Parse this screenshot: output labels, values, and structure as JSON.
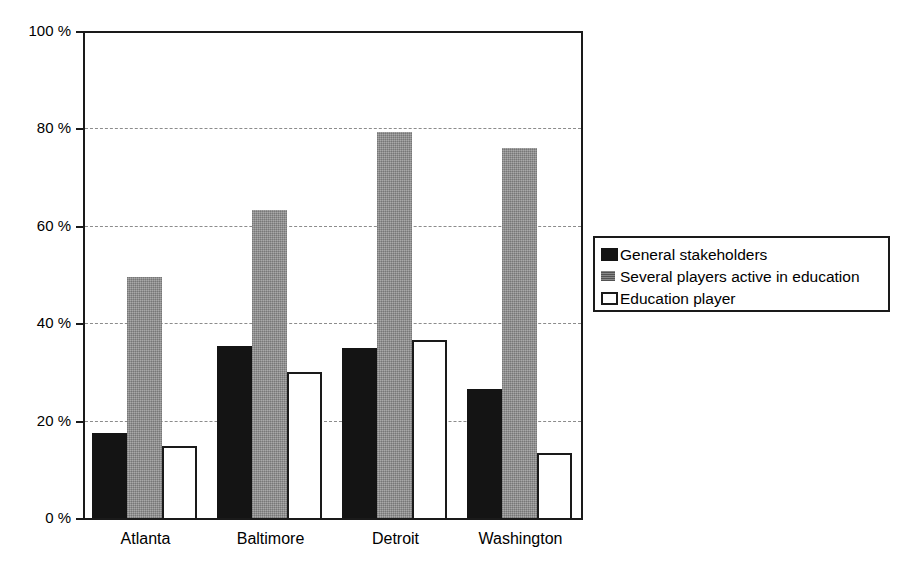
{
  "chart_data": {
    "type": "bar",
    "title": "",
    "subtitle": "",
    "xlabel": "",
    "ylabel": "",
    "grid": true,
    "legend_position": "right",
    "ylim": [
      0,
      100
    ],
    "ytick_values": [
      0,
      20,
      40,
      60,
      80,
      100
    ],
    "ytick_labels": [
      "0 %",
      "20 %",
      "40 %",
      "60 %",
      "80 %",
      "100 %"
    ],
    "categories": [
      "Atlanta",
      "Baltimore",
      "Detroit",
      "Washington"
    ],
    "series": [
      {
        "name": "General stakeholders",
        "color": "#141414",
        "swatch": "solid-black",
        "values": [
          17.5,
          35.3,
          35.0,
          26.5
        ]
      },
      {
        "name": "Several players active in education",
        "color": "#949494",
        "swatch": "gray-halftone",
        "values": [
          49.5,
          63.2,
          79.3,
          76.0
        ]
      },
      {
        "name": "Education player",
        "color": "#ffffff",
        "swatch": "white-outline",
        "values": [
          14.7,
          30.0,
          36.5,
          13.3
        ]
      }
    ]
  },
  "legend": {
    "entries": [
      {
        "label": "General stakeholders"
      },
      {
        "label": "Several players active in education"
      },
      {
        "label": "Education player"
      }
    ]
  },
  "axes": {
    "y": {
      "labels": [
        "100 %",
        "80 %",
        "60 %",
        "40 %",
        "20 %",
        "0 %"
      ]
    },
    "x": {
      "labels": [
        "Atlanta",
        "Baltimore",
        "Detroit",
        "Washington"
      ]
    }
  },
  "colors": {
    "series_1": "#141414",
    "series_2": "#949494",
    "series_3": "#ffffff",
    "frame": "#1a1a1a",
    "gridline": "#8c8c8c",
    "background": "#ffffff"
  }
}
